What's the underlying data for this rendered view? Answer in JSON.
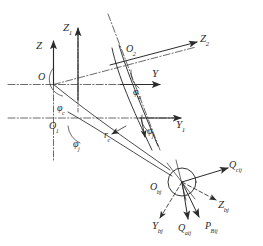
{
  "figure": {
    "type": "kinematic-coordinate-diagram",
    "background_color": "#ffffff",
    "line_color": "#2b2b2b",
    "text_color": "#2b2b2b"
  },
  "axes": [
    {
      "id": "z",
      "base": "Z",
      "sub": "",
      "label": "Z"
    },
    {
      "id": "z1",
      "base": "Z",
      "sub": "1",
      "label": "Z1"
    },
    {
      "id": "z2",
      "base": "Z",
      "sub": "2",
      "label": "Z2"
    },
    {
      "id": "y",
      "base": "Y",
      "sub": "",
      "label": "Y"
    },
    {
      "id": "y1",
      "base": "Y",
      "sub": "1",
      "label": "Y1"
    },
    {
      "id": "zbj",
      "base": "Z",
      "sub": "bj",
      "label": "Zbj"
    },
    {
      "id": "ybj",
      "base": "Y",
      "sub": "bj",
      "label": "Ybj"
    }
  ],
  "points": [
    {
      "id": "o",
      "base": "O",
      "sub": "",
      "label": "O"
    },
    {
      "id": "o1",
      "base": "O",
      "sub": "1",
      "label": "O1"
    },
    {
      "id": "o2",
      "base": "O",
      "sub": "2",
      "label": "O2"
    },
    {
      "id": "obj",
      "base": "O",
      "sub": "bj",
      "label": "Obj"
    }
  ],
  "angles": [
    {
      "id": "phi-c",
      "base": "φ",
      "sub": "c",
      "label": "φc"
    },
    {
      "id": "phi-j",
      "base": "φ",
      "sub": "j",
      "label": "φj"
    },
    {
      "id": "phi-a",
      "base": "φ",
      "sub": "a",
      "label": "φa"
    },
    {
      "id": "phi-j2",
      "base": "φ",
      "sub": "j",
      "label": "φj"
    }
  ],
  "vectors": [
    {
      "id": "q-cij",
      "base": "Q",
      "sub": "cij",
      "label": "Qcij"
    },
    {
      "id": "q-aij",
      "base": "Q",
      "sub": "aij",
      "label": "Qaij"
    },
    {
      "id": "p-bij",
      "base": "P",
      "sub": "Bij",
      "label": "PBij"
    }
  ],
  "misc": [
    {
      "id": "r-c",
      "base": "r",
      "sub": "c",
      "label": "rc"
    }
  ]
}
